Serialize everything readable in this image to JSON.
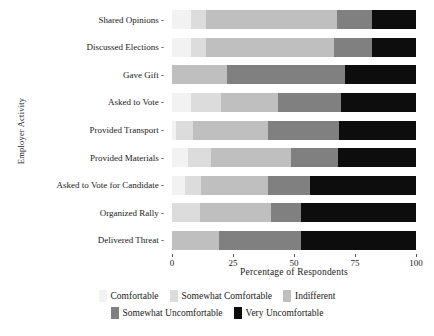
{
  "chart_data": {
    "type": "bar",
    "orientation": "horizontal",
    "stacked": true,
    "normalized": true,
    "title": "",
    "xlabel": "Percentage of Respondents",
    "ylabel": "Employer Activity",
    "xlim": [
      0,
      100
    ],
    "xticks": [
      0,
      25,
      50,
      75,
      100
    ],
    "xticklabels": [
      "0",
      "25",
      "50",
      "75",
      "100"
    ],
    "grid": false,
    "legend_position": "bottom",
    "categories": [
      "Shared Opinions",
      "Discussed Elections",
      "Gave Gift",
      "Asked to Vote",
      "Provided Transport",
      "Provided Materials",
      "Asked to Vote for Candidate",
      "Organized Rally",
      "Delivered Threat"
    ],
    "series": [
      {
        "name": "Comfortable",
        "color": "#f2f2f2",
        "values": [
          7.9,
          7.9,
          0.0,
          7.9,
          1.8,
          6.6,
          5.2,
          0.0,
          0.0
        ]
      },
      {
        "name": "Somewhat Comfortable",
        "color": "#dcdcdc",
        "values": [
          5.9,
          5.9,
          0.0,
          12.3,
          6.8,
          9.5,
          6.6,
          11.3,
          0.0
        ]
      },
      {
        "name": "Indifferent",
        "color": "#bfbfbf",
        "values": [
          53.9,
          52.5,
          22.7,
          23.2,
          30.7,
          32.8,
          27.5,
          29.4,
          19.1
        ]
      },
      {
        "name": "Somewhat Uncomfortable",
        "color": "#808080",
        "values": [
          14.3,
          15.7,
          48.2,
          26.0,
          29.0,
          19.1,
          17.1,
          12.2,
          33.8
        ]
      },
      {
        "name": "Very Uncomfortable",
        "color": "#0d0d0d",
        "values": [
          18.0,
          18.0,
          29.1,
          30.6,
          31.7,
          32.0,
          43.6,
          47.1,
          47.1
        ]
      }
    ]
  },
  "axis": {
    "y_title": "Employer Activity",
    "x_title": "Percentage of Respondents",
    "tick_dash": "-"
  },
  "colors": {
    "background": "#ffffff",
    "text": "#1a1a1a",
    "tick": "#555555"
  }
}
